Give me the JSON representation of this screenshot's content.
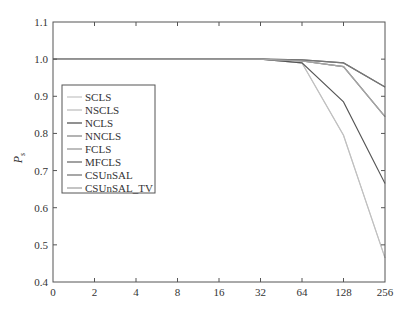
{
  "chart_data": {
    "type": "line",
    "title": "",
    "xlabel": "",
    "ylabel": "P",
    "ylabel_subscript": "s",
    "x": [
      "0",
      "2",
      "4",
      "8",
      "16",
      "32",
      "64",
      "128",
      "256"
    ],
    "ylim": [
      0.4,
      1.1
    ],
    "yticks": [
      "0.4",
      "0.5",
      "0.6",
      "0.7",
      "0.8",
      "0.9",
      "1.0",
      "1.1"
    ],
    "grid": false,
    "legend_position": "center-left",
    "series": [
      {
        "name": "SCLS",
        "color": "#c8c8c8",
        "values": [
          1.0,
          1.0,
          1.0,
          1.0,
          1.0,
          1.0,
          0.99,
          0.795,
          0.465
        ]
      },
      {
        "name": "NSCLS",
        "color": "#c0c0c0",
        "values": [
          1.0,
          1.0,
          1.0,
          1.0,
          1.0,
          1.0,
          0.99,
          0.795,
          0.465
        ]
      },
      {
        "name": "NCLS",
        "color": "#555555",
        "values": [
          1.0,
          1.0,
          1.0,
          1.0,
          1.0,
          1.0,
          0.99,
          0.885,
          0.665
        ]
      },
      {
        "name": "NNCLS",
        "color": "#8a8a8a",
        "values": [
          1.0,
          1.0,
          1.0,
          1.0,
          1.0,
          1.0,
          0.995,
          0.98,
          0.845
        ]
      },
      {
        "name": "FCLS",
        "color": "#9a9a9a",
        "values": [
          1.0,
          1.0,
          1.0,
          1.0,
          1.0,
          1.0,
          0.995,
          0.98,
          0.845
        ]
      },
      {
        "name": "MFCLS",
        "color": "#6e6e6e",
        "values": [
          1.0,
          1.0,
          1.0,
          1.0,
          1.0,
          1.0,
          0.998,
          0.99,
          0.925
        ]
      },
      {
        "name": "CSUnSAL",
        "color": "#777777",
        "values": [
          1.0,
          1.0,
          1.0,
          1.0,
          1.0,
          1.0,
          0.998,
          0.99,
          0.925
        ]
      },
      {
        "name": "CSUnSAL_TV",
        "color": "#a5a5a5",
        "values": [
          1.0,
          1.0,
          1.0,
          1.0,
          1.0,
          1.0,
          0.995,
          0.98,
          0.845
        ]
      }
    ]
  }
}
